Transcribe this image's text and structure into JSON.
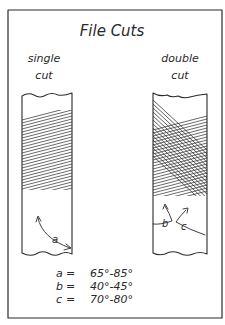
{
  "title": "File Cuts",
  "files": [
    {
      "label_line1": "single",
      "label_line2": "cut",
      "angle_labels": [
        "a"
      ]
    },
    {
      "label_line1": "double",
      "label_line2": "cut",
      "angle_labels": [
        "b",
        "c"
      ]
    }
  ],
  "legend": [
    {
      "symbol": "a",
      "sep": "=",
      "range": "65°-85°"
    },
    {
      "symbol": "b",
      "sep": "=",
      "range": "40°-45°"
    },
    {
      "symbol": "c",
      "sep": "=",
      "range": "70°-80°"
    }
  ],
  "colors": {
    "ink": "#2a2a2a",
    "paper": "#ffffff"
  }
}
